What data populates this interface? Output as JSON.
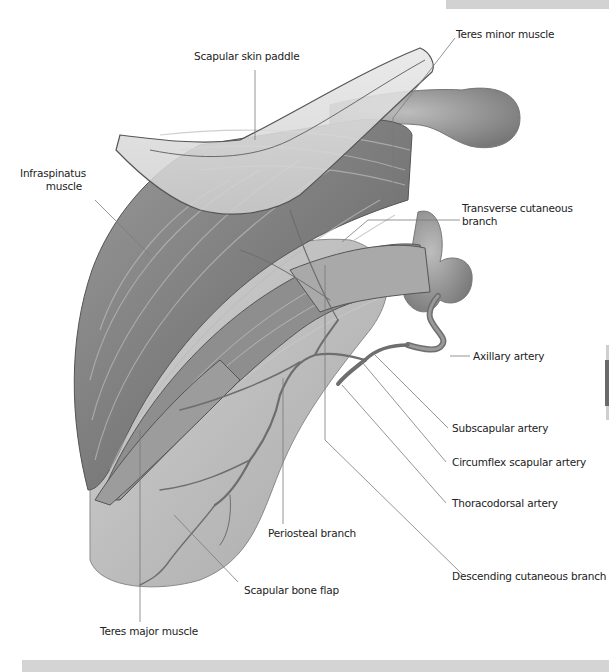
{
  "figure": {
    "labels": {
      "teres_minor": "Teres minor muscle",
      "skin_paddle": "Scapular skin paddle",
      "infraspinatus_line1": "Infraspinatus",
      "infraspinatus_line2": "muscle",
      "transverse_line1": "Transverse cutaneous",
      "transverse_line2": "branch",
      "axillary": "Axillary artery",
      "subscapular": "Subscapular artery",
      "circumflex": "Circumflex scapular artery",
      "thoracodorsal": "Thoracodorsal artery",
      "periosteal": "Periosteal branch",
      "descending": "Descending cutaneous branch",
      "bone_flap": "Scapular bone flap",
      "teres_major": "Teres major muscle"
    },
    "colors": {
      "background": "#ffffff",
      "top_bar": "#d2d2d2",
      "bottom_bar": "#d4d4d4",
      "leader_line": "#6e6e6e",
      "label_text": "#222222",
      "muscle_dark": "#6f6f6f",
      "muscle_light": "#b9b9b9",
      "bone": "#c4c4c4",
      "vessel": "#7a7a7a",
      "skin_paddle": "#d9d9d9"
    }
  }
}
